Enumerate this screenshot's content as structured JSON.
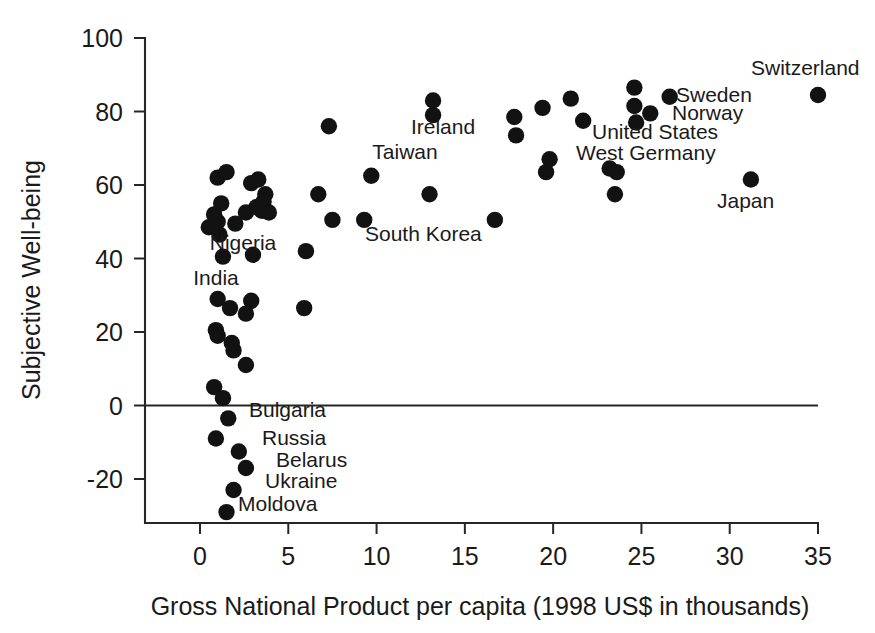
{
  "chart_data": {
    "type": "scatter",
    "title": "",
    "xlabel": "Gross National Product per capita (1998 US$ in thousands)",
    "ylabel": "Subjective Well-being",
    "xlim": [
      -1.2,
      35
    ],
    "ylim": [
      -32,
      100
    ],
    "grid": false,
    "legend": null,
    "xticks": [
      0,
      5,
      10,
      15,
      20,
      25,
      30,
      35
    ],
    "xtick_labels": [
      "0",
      "5",
      "10",
      "15",
      "20",
      "25",
      "30",
      "35"
    ],
    "yticks": [
      -20,
      0,
      20,
      40,
      60,
      80,
      100
    ],
    "ytick_labels": [
      "-20",
      "0",
      "20",
      "40",
      "60",
      "80",
      "100"
    ],
    "zero_reference_line": 0,
    "marker": "filled-circle",
    "marker_color": "#121212",
    "points": [
      {
        "x": 0.5,
        "y": 48.5,
        "label": ""
      },
      {
        "x": 0.8,
        "y": 52.0,
        "label": ""
      },
      {
        "x": 1.0,
        "y": 62.0,
        "label": ""
      },
      {
        "x": 1.5,
        "y": 63.5,
        "label": ""
      },
      {
        "x": 1.2,
        "y": 55.0,
        "label": ""
      },
      {
        "x": 1.0,
        "y": 50.0,
        "label": ""
      },
      {
        "x": 1.1,
        "y": 46.5,
        "label": ""
      },
      {
        "x": 2.0,
        "y": 49.5,
        "label": ""
      },
      {
        "x": 2.6,
        "y": 52.5,
        "label": ""
      },
      {
        "x": 2.9,
        "y": 60.5,
        "label": ""
      },
      {
        "x": 3.3,
        "y": 61.5,
        "label": ""
      },
      {
        "x": 3.7,
        "y": 57.5,
        "label": ""
      },
      {
        "x": 3.2,
        "y": 54.0,
        "label": ""
      },
      {
        "x": 3.5,
        "y": 53.0,
        "label": ""
      },
      {
        "x": 3.6,
        "y": 55.5,
        "label": ""
      },
      {
        "x": 3.9,
        "y": 52.5,
        "label": ""
      },
      {
        "x": 1.3,
        "y": 40.5,
        "label": "Nigeria"
      },
      {
        "x": 3.0,
        "y": 41.0,
        "label": ""
      },
      {
        "x": 1.0,
        "y": 29.0,
        "label": "India"
      },
      {
        "x": 1.7,
        "y": 26.5,
        "label": ""
      },
      {
        "x": 2.9,
        "y": 28.5,
        "label": ""
      },
      {
        "x": 2.6,
        "y": 25.0,
        "label": ""
      },
      {
        "x": 0.9,
        "y": 20.5,
        "label": ""
      },
      {
        "x": 1.0,
        "y": 19.0,
        "label": ""
      },
      {
        "x": 1.8,
        "y": 17.0,
        "label": ""
      },
      {
        "x": 1.9,
        "y": 15.0,
        "label": ""
      },
      {
        "x": 2.6,
        "y": 11.0,
        "label": ""
      },
      {
        "x": 0.8,
        "y": 5.0,
        "label": ""
      },
      {
        "x": 1.3,
        "y": 2.0,
        "label": ""
      },
      {
        "x": 1.6,
        "y": -3.5,
        "label": "Bulgaria"
      },
      {
        "x": 0.9,
        "y": -9.0,
        "label": ""
      },
      {
        "x": 2.2,
        "y": -12.5,
        "label": "Russia"
      },
      {
        "x": 2.6,
        "y": -17.0,
        "label": "Belarus"
      },
      {
        "x": 1.9,
        "y": -23.0,
        "label": "Ukraine"
      },
      {
        "x": 1.5,
        "y": -29.0,
        "label": "Moldova"
      },
      {
        "x": 5.9,
        "y": 26.5,
        "label": ""
      },
      {
        "x": 6.0,
        "y": 42.0,
        "label": ""
      },
      {
        "x": 6.7,
        "y": 57.5,
        "label": ""
      },
      {
        "x": 7.3,
        "y": 76.0,
        "label": ""
      },
      {
        "x": 7.5,
        "y": 50.5,
        "label": ""
      },
      {
        "x": 9.3,
        "y": 50.5,
        "label": "South Korea"
      },
      {
        "x": 9.7,
        "y": 62.5,
        "label": "Taiwan"
      },
      {
        "x": 13.2,
        "y": 83.0,
        "label": "Ireland"
      },
      {
        "x": 13.2,
        "y": 79.0,
        "label": ""
      },
      {
        "x": 13.0,
        "y": 57.5,
        "label": ""
      },
      {
        "x": 16.7,
        "y": 50.5,
        "label": ""
      },
      {
        "x": 17.8,
        "y": 78.5,
        "label": ""
      },
      {
        "x": 17.9,
        "y": 73.5,
        "label": ""
      },
      {
        "x": 19.4,
        "y": 81.0,
        "label": ""
      },
      {
        "x": 19.6,
        "y": 63.5,
        "label": ""
      },
      {
        "x": 19.8,
        "y": 67.0,
        "label": ""
      },
      {
        "x": 21.0,
        "y": 83.5,
        "label": ""
      },
      {
        "x": 21.7,
        "y": 77.5,
        "label": ""
      },
      {
        "x": 23.2,
        "y": 64.5,
        "label": "West Germany"
      },
      {
        "x": 23.6,
        "y": 63.5,
        "label": ""
      },
      {
        "x": 23.5,
        "y": 57.5,
        "label": ""
      },
      {
        "x": 24.6,
        "y": 86.5,
        "label": ""
      },
      {
        "x": 24.6,
        "y": 81.5,
        "label": ""
      },
      {
        "x": 24.7,
        "y": 77.0,
        "label": "United States"
      },
      {
        "x": 25.5,
        "y": 79.5,
        "label": "Norway"
      },
      {
        "x": 26.6,
        "y": 84.0,
        "label": "Sweden"
      },
      {
        "x": 31.2,
        "y": 61.5,
        "label": "Japan"
      },
      {
        "x": 35.0,
        "y": 84.5,
        "label": "Switzerland"
      }
    ],
    "annotations": [
      {
        "text": "Nigeria",
        "x_px": 243,
        "y_px": 250,
        "anchor": "middle"
      },
      {
        "text": "India",
        "x_px": 216,
        "y_px": 285,
        "anchor": "middle"
      },
      {
        "text": "Bulgaria",
        "x_px": 249,
        "y_px": 417,
        "anchor": "start"
      },
      {
        "text": "Russia",
        "x_px": 262,
        "y_px": 445,
        "anchor": "start"
      },
      {
        "text": "Belarus",
        "x_px": 276,
        "y_px": 467,
        "anchor": "start"
      },
      {
        "text": "Ukraine",
        "x_px": 265,
        "y_px": 488,
        "anchor": "start"
      },
      {
        "text": "Moldova",
        "x_px": 238,
        "y_px": 511,
        "anchor": "start"
      },
      {
        "text": "South Korea",
        "x_px": 365,
        "y_px": 241,
        "anchor": "start"
      },
      {
        "text": "Taiwan",
        "x_px": 405,
        "y_px": 159,
        "anchor": "middle"
      },
      {
        "text": "Ireland",
        "x_px": 443,
        "y_px": 134,
        "anchor": "middle"
      },
      {
        "text": "West Germany",
        "x_px": 576,
        "y_px": 160,
        "anchor": "start"
      },
      {
        "text": "United States",
        "x_px": 592,
        "y_px": 139,
        "anchor": "start"
      },
      {
        "text": "Norway",
        "x_px": 672,
        "y_px": 120,
        "anchor": "start"
      },
      {
        "text": "Sweden",
        "x_px": 676,
        "y_px": 102,
        "anchor": "start"
      },
      {
        "text": "Japan",
        "x_px": 717,
        "y_px": 208,
        "anchor": "start"
      },
      {
        "text": "Switzerland",
        "x_px": 751,
        "y_px": 75,
        "anchor": "start"
      }
    ]
  },
  "axes": {
    "x_axis_title": "Gross National Product per capita (1998 US$ in thousands)",
    "y_axis_title": "Subjective Well-being"
  }
}
